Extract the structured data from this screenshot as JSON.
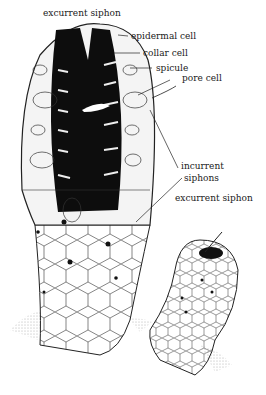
{
  "diagram": {
    "labels": {
      "excurrent_top": "excurrent siphon",
      "epidermal": "epidermal cell",
      "collar": "collar cell",
      "spicule": "spicule",
      "pore": "pore cell",
      "incurrent_line1": "incurrent",
      "incurrent_line2": "siphons",
      "excurrent_right": "excurrent siphon"
    }
  }
}
